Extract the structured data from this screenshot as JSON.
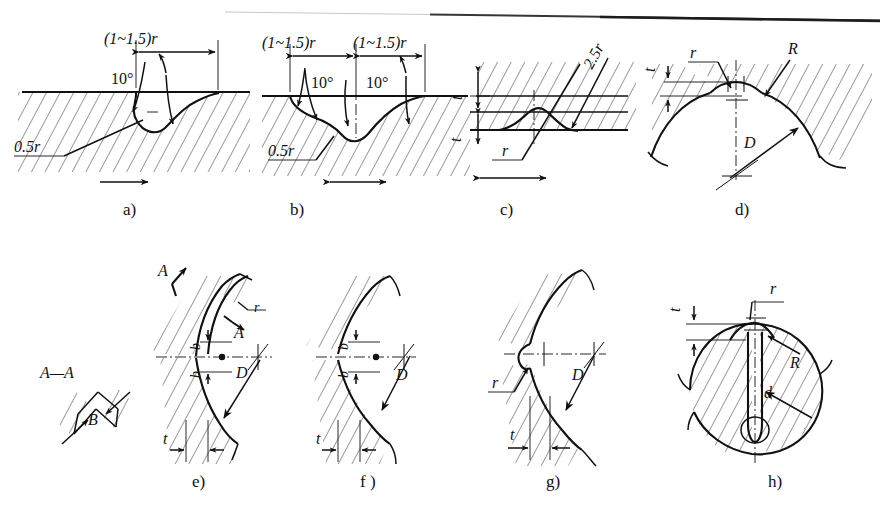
{
  "figure": {
    "kind": "technical-drawing",
    "background_color": "#ffffff",
    "line_color": "#111111",
    "hatch_color": "#2a2a2a",
    "top_artifact": "page-edge-scan-line"
  },
  "section_view": {
    "title": "A—A",
    "dimension": "B"
  },
  "panels": [
    {
      "id": "a",
      "label": "a)",
      "annotations": [
        "(1~1.5)r",
        "10°",
        "0.5r"
      ],
      "flow_arrow": "single-right"
    },
    {
      "id": "b",
      "label": "b)",
      "annotations": [
        "(1~1.5)r",
        "(1~1.5)r",
        "10°",
        "10°",
        "0.5r"
      ],
      "flow_arrow": "double"
    },
    {
      "id": "c",
      "label": "c)",
      "annotations": [
        "2.5r",
        "t",
        "r"
      ],
      "flow_arrow": "double"
    },
    {
      "id": "d",
      "label": "d)",
      "annotations": [
        "t",
        "r",
        "R",
        "D"
      ],
      "flow_arrow": "none"
    },
    {
      "id": "e",
      "label": "e)",
      "annotations": [
        "A",
        "A",
        "r",
        "b",
        "b",
        "D",
        "t"
      ],
      "flow_arrow": "none"
    },
    {
      "id": "f",
      "label": "f )",
      "annotations": [
        "b",
        "b",
        "D",
        "t"
      ],
      "flow_arrow": "none"
    },
    {
      "id": "g",
      "label": "g)",
      "annotations": [
        "r",
        "D",
        "t"
      ],
      "flow_arrow": "none"
    },
    {
      "id": "h",
      "label": "h)",
      "annotations": [
        "r",
        "t",
        "R",
        "d"
      ],
      "flow_arrow": "none"
    }
  ],
  "text": {
    "dim_1_15r": "(1~1.5)r",
    "dim_05r": "0.5r",
    "dim_25r": "2.5r",
    "ang_10": "10°",
    "sym_t": "t",
    "sym_r": "r",
    "sym_R": "R",
    "sym_D": "D",
    "sym_d": "d",
    "sym_b": "b",
    "sym_A": "A",
    "sym_B": "B",
    "sect_AA": "A—A",
    "label_a": "a)",
    "label_b": "b)",
    "label_c": "c)",
    "label_d": "d)",
    "label_e": "e)",
    "label_f": "f )",
    "label_g": "g)",
    "label_h": "h)"
  }
}
